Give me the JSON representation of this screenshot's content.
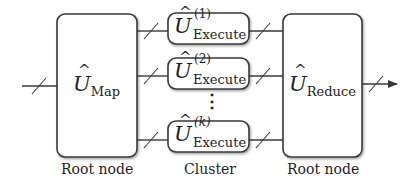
{
  "diagram": {
    "type": "quantum-mapreduce-circuit",
    "nodes": {
      "map": {
        "symbol": "U",
        "hat": "^",
        "subscript": "Map",
        "caption": "Root node"
      },
      "executes": [
        {
          "symbol": "U",
          "hat": "^",
          "superscript": "(1)",
          "subscript": "Execute"
        },
        {
          "symbol": "U",
          "hat": "^",
          "superscript": "(2)",
          "subscript": "Execute"
        },
        {
          "symbol": "U",
          "hat": "^",
          "superscript": "(k)",
          "subscript": "Execute"
        }
      ],
      "ellipsis": "⋮",
      "cluster_caption": "Cluster",
      "reduce": {
        "symbol": "U",
        "hat": "^",
        "subscript": "Reduce",
        "caption": "Root node"
      }
    },
    "colors": {
      "stroke": "#3a3a3a",
      "text": "#1e1e1e",
      "background": "#ffffff"
    }
  }
}
